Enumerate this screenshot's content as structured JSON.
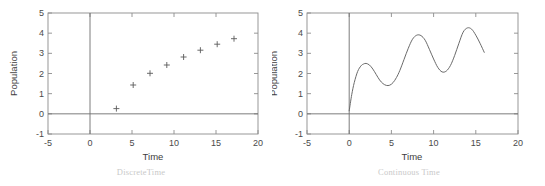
{
  "figure": {
    "background": "#ffffff",
    "axis_color": "#8c8c8c",
    "data_color": "#5a5a5a",
    "caption_color": "#c9c9c9"
  },
  "panels": [
    {
      "id": "discrete-time-plot",
      "caption": "DiscreteTime",
      "chart_data": {
        "type": "scatter",
        "title": "",
        "xlabel": "Time",
        "ylabel": "Population",
        "xlim": [
          -5,
          20
        ],
        "ylim": [
          -1,
          5
        ],
        "xticks": [
          -5,
          0,
          5,
          10,
          15,
          20
        ],
        "yticks": [
          -1,
          0,
          1,
          2,
          3,
          4,
          5
        ],
        "xtick_labels": [
          "-5",
          "0",
          "5",
          "10",
          "15",
          "20"
        ],
        "ytick_labels": [
          "-1",
          "0",
          "1",
          "2",
          "3",
          "4",
          "5"
        ],
        "grid": false,
        "legend": null,
        "marker": "plus",
        "x": [
          2,
          4,
          6,
          8,
          10,
          12,
          14,
          16
        ],
        "y": [
          0.26,
          1.43,
          2.01,
          2.42,
          2.82,
          3.15,
          3.45,
          3.72
        ],
        "annotations": [
          "horizontal zero reference line at y = 0",
          "vertical reference line at x = 0"
        ]
      }
    },
    {
      "id": "continuous-time-plot",
      "caption": "Continuous Time",
      "chart_data": {
        "type": "line",
        "title": "",
        "xlabel": "Time",
        "ylabel": "Population",
        "xlim": [
          -5,
          20
        ],
        "ylim": [
          -1,
          5
        ],
        "xticks": [
          -5,
          0,
          5,
          10,
          15,
          20
        ],
        "yticks": [
          -1,
          0,
          1,
          2,
          3,
          4,
          5
        ],
        "xtick_labels": [
          "-5",
          "0",
          "5",
          "10",
          "15",
          "20"
        ],
        "ytick_labels": [
          "-1",
          "0",
          "1",
          "2",
          "3",
          "4",
          "5"
        ],
        "grid": false,
        "legend": null,
        "x": [
          0.0,
          0.3,
          0.6,
          1.0,
          1.4,
          1.7,
          2.0,
          2.4,
          2.8,
          3.2,
          3.6,
          4.0,
          4.4,
          4.8,
          5.2,
          5.6,
          6.0,
          6.5,
          7.0,
          7.5,
          8.0,
          8.5,
          9.0,
          9.5,
          10.0,
          10.5,
          11.0,
          11.5,
          12.0,
          12.5,
          13.0,
          13.5,
          14.0,
          14.5,
          15.0,
          15.5,
          16.0
        ],
        "y": [
          0.15,
          0.95,
          1.55,
          2.1,
          2.38,
          2.47,
          2.5,
          2.42,
          2.22,
          1.95,
          1.68,
          1.5,
          1.41,
          1.42,
          1.55,
          1.8,
          2.15,
          2.7,
          3.25,
          3.7,
          3.9,
          3.88,
          3.65,
          3.2,
          2.72,
          2.3,
          2.08,
          2.12,
          2.4,
          2.9,
          3.5,
          4.05,
          4.26,
          4.2,
          3.9,
          3.5,
          3.05
        ],
        "annotations": [
          "horizontal zero reference line at y = 0",
          "vertical reference line at x = 0"
        ]
      }
    }
  ]
}
